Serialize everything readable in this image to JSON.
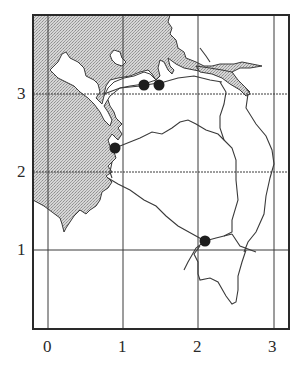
{
  "map": {
    "frame": {
      "x": 33,
      "y": 15,
      "width": 256,
      "height": 314
    },
    "colors": {
      "frame": "#2a2a2a",
      "grid": "#3a3a3a",
      "land_fill": "#c8c8c8",
      "coast_stroke": "#3a3a3a",
      "route_stroke": "#3a3a3a",
      "marker": "#1e1e1e",
      "background": "#ffffff"
    },
    "x_axis": {
      "ticks": [
        {
          "label": "0",
          "value": 0
        },
        {
          "label": "1",
          "value": 1
        },
        {
          "label": "2",
          "value": 2
        },
        {
          "label": "3",
          "value": 3
        }
      ]
    },
    "y_axis": {
      "ticks": [
        {
          "label": "1",
          "value": 1
        },
        {
          "label": "2",
          "value": 2
        },
        {
          "label": "3",
          "value": 3
        }
      ]
    },
    "markers": [
      {
        "id": "north-west",
        "x": 1.3,
        "y": 3.1
      },
      {
        "id": "north-east",
        "x": 1.5,
        "y": 3.1
      },
      {
        "id": "west",
        "x": 0.9,
        "y": 2.3
      },
      {
        "id": "south",
        "x": 2.1,
        "y": 1.1
      }
    ]
  }
}
